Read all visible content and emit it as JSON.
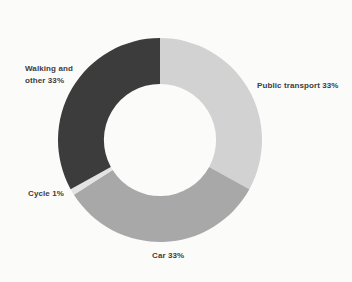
{
  "chart_data": {
    "type": "pie",
    "subtype": "donut",
    "title": "",
    "total": 100,
    "unit": "%",
    "start_angle_deg": 0,
    "direction": "clockwise",
    "inner_radius_ratio": 0.55,
    "segments": [
      {
        "name": "Public transport",
        "value": 33,
        "label": "Public transport 33%",
        "color": "#d2d2d2"
      },
      {
        "name": "Car",
        "value": 33,
        "label": "Car 33%",
        "color": "#a8a8a8"
      },
      {
        "name": "Cycle",
        "value": 1,
        "label": "Cycle 1%",
        "color": "#e3e3e3"
      },
      {
        "name": "Walking and other",
        "value": 33,
        "label": "Walking and other 33%",
        "color": "#3c3c3c"
      }
    ],
    "legend_position": "none",
    "labels_outside": true
  },
  "colors": {
    "background": "#fbfbf9",
    "label_text": "#3d3d3d"
  }
}
